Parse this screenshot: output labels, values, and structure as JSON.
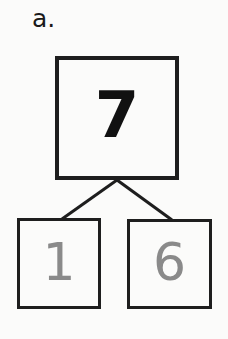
{
  "problem_label": "a.",
  "number_bond": {
    "whole": "7",
    "parts": [
      "1",
      "6"
    ]
  },
  "colors": {
    "whole_text": "#111111",
    "part_text": "#8a8a8a",
    "box_border": "#1e1e1e"
  }
}
